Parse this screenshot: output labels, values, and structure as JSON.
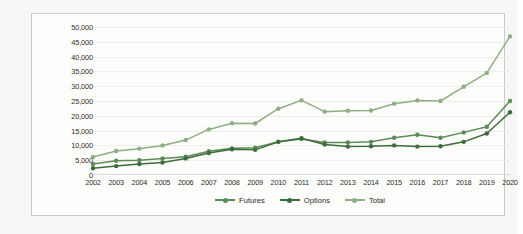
{
  "chart_data": {
    "type": "line",
    "title": "",
    "subtitle": "",
    "xlabel": "",
    "ylabel": "",
    "categories": [
      "2002",
      "2003",
      "2004",
      "2005",
      "2006",
      "2007",
      "2008",
      "2009",
      "2010",
      "2011",
      "2012",
      "2013",
      "2014",
      "2015",
      "2016",
      "2017",
      "2018",
      "2019",
      "2020"
    ],
    "ylim": [
      0,
      50000
    ],
    "ytick_labels": [
      "0",
      "5,000",
      "10,000",
      "15,000",
      "20,000",
      "25,000",
      "30,000",
      "35,000",
      "40,000",
      "45,000",
      "50,000"
    ],
    "ytick_values": [
      0,
      5000,
      10000,
      15000,
      20000,
      25000,
      30000,
      35000,
      40000,
      45000,
      50000
    ],
    "grid": true,
    "legend_position": "bottom",
    "series": [
      {
        "name": "Futures",
        "color": "#5d8a57",
        "values": [
          3700,
          4800,
          5000,
          5600,
          6200,
          8000,
          9000,
          9200,
          11200,
          12200,
          11000,
          11000,
          11200,
          12600,
          13600,
          12600,
          14400,
          16300,
          25000
        ]
      },
      {
        "name": "Options",
        "color": "#3d6b3a",
        "values": [
          2300,
          3000,
          3700,
          4200,
          5600,
          7400,
          8700,
          8500,
          11200,
          12400,
          10300,
          9600,
          9700,
          10000,
          9600,
          9700,
          11200,
          14000,
          21200
        ]
      },
      {
        "name": "Total",
        "color": "#8fae84",
        "values": [
          6100,
          8100,
          8900,
          10000,
          11800,
          15400,
          17500,
          17400,
          22400,
          25200,
          21400,
          21700,
          21800,
          24100,
          25200,
          25000,
          29800,
          34500,
          46800
        ]
      }
    ]
  },
  "legend": {
    "items": [
      {
        "label": "Futures",
        "color": "#5d8a57"
      },
      {
        "label": "Options",
        "color": "#3d6b3a"
      },
      {
        "label": "Total",
        "color": "#8fae84"
      }
    ]
  },
  "colors": {
    "page_background": "#f7f7f5",
    "chart_background": "#fdfdfc",
    "frame_border": "#c9cbc6",
    "gridline": "#eceeea",
    "axis_text": "#2c2c2c"
  }
}
